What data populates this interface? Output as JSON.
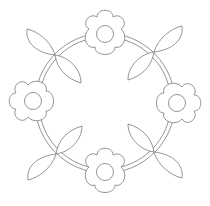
{
  "image": {
    "description": "Line-art coloring page of a floral wreath",
    "stroke_color": "#7a7a7a",
    "background": "#ffffff",
    "ring": {
      "cx": 105,
      "cy": 103,
      "r_outer": 70,
      "r_inner": 66
    },
    "flowers": [
      {
        "name": "top",
        "cx": 105,
        "cy": 34
      },
      {
        "name": "right",
        "cx": 177,
        "cy": 103
      },
      {
        "name": "bottom",
        "cx": 105,
        "cy": 172
      },
      {
        "name": "left",
        "cx": 33,
        "cy": 101
      }
    ],
    "leaf_pairs": [
      {
        "name": "top-left",
        "x": 55,
        "y": 55
      },
      {
        "name": "top-right",
        "x": 154,
        "y": 52
      },
      {
        "name": "bottom-left",
        "x": 56,
        "y": 154
      },
      {
        "name": "bottom-right",
        "x": 154,
        "y": 152
      }
    ]
  }
}
